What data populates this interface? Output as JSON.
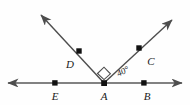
{
  "figure": {
    "type": "geometry-diagram",
    "background_color": "#fefefe",
    "line_color": "#4d4d4d",
    "point_color": "#111111",
    "label_color": "#1a1a1a",
    "points": [
      {
        "id": "E",
        "label": "E",
        "x": 55,
        "y": 83,
        "label_x": 55,
        "label_y": 99
      },
      {
        "id": "A",
        "label": "A",
        "x": 104,
        "y": 83,
        "label_x": 104,
        "label_y": 99
      },
      {
        "id": "B",
        "label": "B",
        "x": 144,
        "y": 83,
        "label_x": 146,
        "label_y": 99
      },
      {
        "id": "D",
        "label": "D",
        "x": 79,
        "y": 51,
        "label_x": 71,
        "label_y": 67
      },
      {
        "id": "C",
        "label": "C",
        "x": 139,
        "y": 48,
        "label_x": 150,
        "label_y": 64
      }
    ],
    "segments": [
      {
        "id": "line-EB",
        "name": "horizontal-line",
        "x1": 8,
        "y1": 83,
        "x2": 182,
        "y2": 83,
        "arrow_start": true,
        "arrow_end": true
      },
      {
        "id": "ray-AD",
        "name": "ray-up-left",
        "x1": 104,
        "y1": 83,
        "x2": 40,
        "y2": 14,
        "arrow_start": false,
        "arrow_end": true
      },
      {
        "id": "ray-AC",
        "name": "ray-up-right",
        "x1": 104,
        "y1": 83,
        "x2": 173,
        "y2": 19,
        "arrow_start": false,
        "arrow_end": true
      }
    ],
    "angles": [
      {
        "id": "angle-DAC",
        "type": "right-angle",
        "label": "",
        "vertex": "A",
        "marker": "square",
        "marker_size": 9
      },
      {
        "id": "angle-CAB",
        "type": "measured",
        "label": "40°",
        "value": 40,
        "unit": "degrees",
        "vertex": "A",
        "label_x": 124,
        "label_y": 73,
        "rotation": -28
      }
    ]
  }
}
